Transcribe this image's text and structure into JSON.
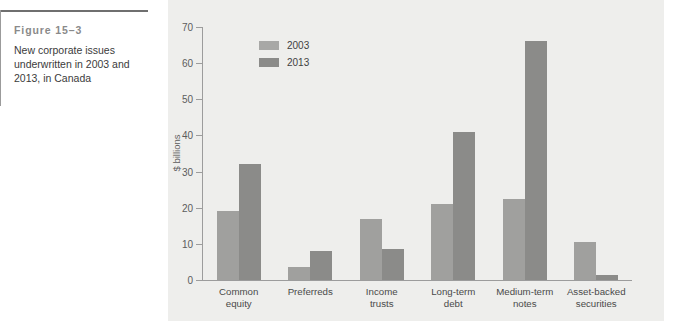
{
  "caption": {
    "figure_number": "Figure 15–3",
    "text": "New corporate issues underwritten in 2003 and 2013, in Canada"
  },
  "colors": {
    "panel_background": "#eeeeec",
    "series_2003": "#a0a09e",
    "series_2013": "#8b8b89",
    "axis": "#9c9c9c",
    "caption_rule": "#6f6f6f"
  },
  "chart_data": {
    "type": "bar",
    "title": "",
    "xlabel": "",
    "ylabel": "$ billions",
    "ylim": [
      0,
      70
    ],
    "yticks": [
      0,
      10,
      20,
      30,
      40,
      50,
      60,
      70
    ],
    "ytick_labels": [
      "0",
      "10",
      "20",
      "30",
      "40",
      "50",
      "60",
      "70"
    ],
    "grid": false,
    "legend_position": "top-left",
    "categories": [
      "Common equity",
      "Preferreds",
      "Income trusts",
      "Long-term debt",
      "Medium-term notes",
      "Asset-backed securities"
    ],
    "category_lines": [
      [
        "Common",
        "equity"
      ],
      [
        "Preferreds"
      ],
      [
        "Income",
        "trusts"
      ],
      [
        "Long-term",
        "debt"
      ],
      [
        "Medium-term",
        "notes"
      ],
      [
        "Asset-backed",
        "securities"
      ]
    ],
    "series": [
      {
        "name": "2003",
        "color": "#a0a09e",
        "values": [
          19,
          3.5,
          17,
          21,
          22.5,
          10.5
        ]
      },
      {
        "name": "2013",
        "color": "#8b8b89",
        "values": [
          32,
          8,
          8.5,
          41,
          66,
          1.5
        ]
      }
    ]
  }
}
